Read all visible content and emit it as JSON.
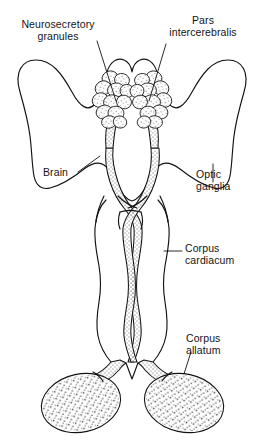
{
  "figure": {
    "type": "anatomical-line-drawing",
    "width": 263,
    "height": 442,
    "background_color": "#ffffff",
    "ink_color": "#121212"
  },
  "labels": {
    "neurosecretory_granules": "Neurosecretory\ngranules",
    "pars_intercerebralis": "Pars\nintercerebralis",
    "brain": "Brain",
    "optic_ganglia": "Optic\nganglia",
    "corpus_cardiacum": "Corpus\ncardiacum",
    "corpus_allatum": "Corpus\nallatum"
  },
  "structures": [
    {
      "name": "brain",
      "label": "Brain",
      "description": "Large bilobed outline spanning the upper portion of the figure with two dorsal lobes and lateral optic lobes"
    },
    {
      "name": "pars-intercerebralis",
      "label": "Pars intercerebralis",
      "description": "Median dorsal region of the brain between the two protocerebral lobes"
    },
    {
      "name": "neurosecretory-granules",
      "label": "Neurosecretory granules",
      "description": "Paired clusters of grape-like neurosecretory cell bodies in the pars intercerebralis"
    },
    {
      "name": "optic-ganglia",
      "label": "Optic ganglia",
      "description": "Lateral lobes of the brain, left and right"
    },
    {
      "name": "corpus-cardiacum",
      "label": "Corpus cardiacum",
      "description": "Paired elongate glands below the brain receiving stippled axon tracts"
    },
    {
      "name": "corpus-allatum",
      "label": "Corpus allatum",
      "description": "Paired rounded stippled glands at the base of the figure"
    },
    {
      "name": "nervi-corporis-cardiaci",
      "label": "",
      "description": "Crossing stippled axon tracts descending from neurosecretory cells to the corpora cardiaca"
    }
  ]
}
